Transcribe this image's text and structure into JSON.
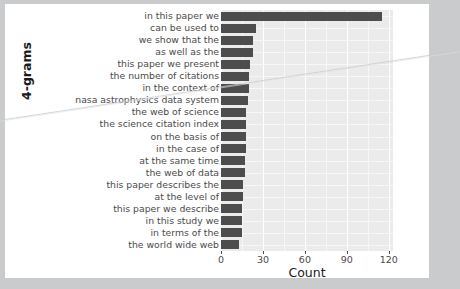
{
  "chart_data": {
    "type": "bar",
    "orientation": "horizontal",
    "title": "",
    "xlabel": "Count",
    "ylabel": "4-grams",
    "xlim": [
      0,
      123
    ],
    "xticks": [
      0,
      30,
      60,
      90,
      120
    ],
    "xtick_labels": [
      "0",
      "30",
      "60",
      "90",
      "120"
    ],
    "grid": true,
    "legend": "none",
    "bar_color": "#4d4d4d",
    "panel_color": "#ebebeb",
    "gridline_color": "#ffffff",
    "categories": [
      "in this paper we",
      "can be used to",
      "we show that the",
      "as well as the",
      "this paper we present",
      "the number of citations",
      "in the context of",
      "nasa astrophysics data system",
      "the web of science",
      "the science citation index",
      "on the basis of",
      "in the case of",
      "at the same time",
      "the web of data",
      "this paper describes the",
      "at the level of",
      "this paper we describe",
      "in this study we",
      "in terms of the",
      "the world wide web"
    ],
    "values": [
      115,
      25,
      23,
      23,
      21,
      20,
      20,
      19,
      18,
      18,
      18,
      18,
      17,
      17,
      16,
      16,
      15,
      15,
      15,
      13
    ]
  }
}
